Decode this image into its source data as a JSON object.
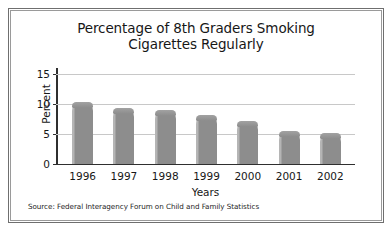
{
  "figure": {
    "background_color": "#ffffff",
    "frame_outer_color": "#6f6f6f",
    "frame_inner_color": "#9a9a9a"
  },
  "chart_data": {
    "type": "bar",
    "title": "Percentage of 8th Graders Smoking\nCigarettes Regularly",
    "title_line1": "Percentage of 8th Graders Smoking",
    "title_line2": "Cigarettes Regularly",
    "xlabel": "Years",
    "ylabel": "Percent",
    "categories": [
      "1996",
      "1997",
      "1998",
      "1999",
      "2000",
      "2001",
      "2002"
    ],
    "values": [
      10.4,
      9.3,
      9.0,
      8.1,
      7.2,
      5.5,
      5.1
    ],
    "ylim": [
      0,
      15
    ],
    "yticks": [
      "0",
      "5",
      "10",
      "15"
    ],
    "ytick_values": [
      0,
      5,
      10,
      15
    ],
    "grid": true,
    "grid_axis": "y",
    "legend": "none",
    "bar_color": "#8d8d8d",
    "grid_color": "#c8c8c8",
    "axis_color": "#2f2f2f",
    "source": "Source: Federal Interagency Forum on Child and Family Statistics"
  }
}
